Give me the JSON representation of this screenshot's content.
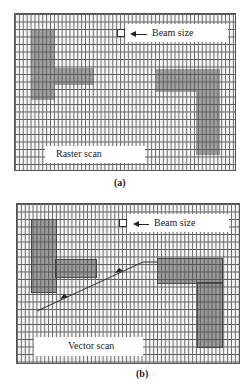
{
  "panel_a": {
    "caption": "(a)",
    "beam_label": "Beam size",
    "scan_label": "Raster scan",
    "shapes": [
      {
        "name": "left-t-vertical",
        "x": 31,
        "y": 30,
        "w": 24,
        "h": 70
      },
      {
        "name": "left-t-horizontal",
        "x": 31,
        "y": 68,
        "w": 63,
        "h": 17
      },
      {
        "name": "right-l-horizontal",
        "x": 156,
        "y": 69,
        "w": 64,
        "h": 23
      },
      {
        "name": "right-l-vertical",
        "x": 196,
        "y": 69,
        "w": 24,
        "h": 86
      }
    ]
  },
  "panel_b": {
    "caption": "(b)",
    "beam_label": "Beam size",
    "scan_label": "Vector scan",
    "shapes": [
      {
        "name": "left-t-vertical",
        "x": 32,
        "y": 220,
        "w": 24,
        "h": 72
      },
      {
        "name": "left-t-horizontal",
        "x": 32,
        "y": 260,
        "w": 64,
        "h": 17
      },
      {
        "name": "right-l-horizontal",
        "x": 158,
        "y": 259,
        "w": 64,
        "h": 24
      },
      {
        "name": "right-l-vertical",
        "x": 198,
        "y": 259,
        "w": 24,
        "h": 88
      }
    ],
    "vector_path": [
      [
        37,
        311
      ],
      [
        143,
        262
      ],
      [
        158,
        262
      ]
    ]
  },
  "colors": {
    "grid_line": "#555555",
    "shape_fill": "#8c8c8c",
    "background": "#ffffff"
  }
}
